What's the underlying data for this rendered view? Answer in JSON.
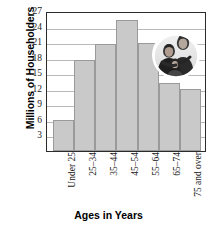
{
  "chart_data": {
    "type": "bar",
    "title": "",
    "xlabel": "Ages in Years",
    "ylabel": "Millions of Householders",
    "categories": [
      "Under 25",
      "25–34",
      "35–44",
      "45–54",
      "55–64",
      "65–74",
      "75 and over"
    ],
    "values": [
      5.9,
      17.5,
      20.7,
      25.3,
      20.8,
      13.2,
      12.0
    ],
    "ylim": [
      0,
      27
    ],
    "yticks": [
      3,
      6,
      9,
      12,
      15,
      18,
      21,
      24,
      27
    ],
    "ytick_labels": [
      "3",
      "6",
      "9",
      "12",
      "15",
      "18",
      "21",
      "24",
      "27"
    ],
    "grid": true,
    "legend": false,
    "bar_color": "#c9c9c9",
    "bar_edge_color": "#9a9a9a",
    "axis_color": "#2b2b2b",
    "gridline_color": "#b9b9b9"
  },
  "inset": {
    "photo_name": "family-photograph-oval",
    "description": "Oval black-and-white photograph of a family"
  }
}
